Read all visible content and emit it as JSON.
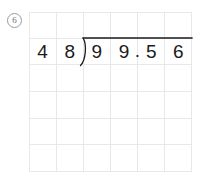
{
  "worksheet": {
    "problem_number": "6",
    "grid": {
      "columns": 6,
      "rows": 6
    },
    "division": {
      "divisor": "48",
      "dividend": "99.56",
      "expression": "99.56 ÷ 48",
      "divisor_digits": [
        "4",
        "8"
      ],
      "dividend_digits": [
        "9",
        "9",
        "5",
        "6"
      ],
      "decimal_point": ".",
      "decimal_after_index": 2,
      "quotient": ""
    },
    "colors": {
      "grid_line": "#e8e8ea",
      "digit": "#1b1b1b",
      "bracket": "#1b1b1b",
      "problem_number": "#6e6e6e",
      "background": "#ffffff"
    }
  }
}
